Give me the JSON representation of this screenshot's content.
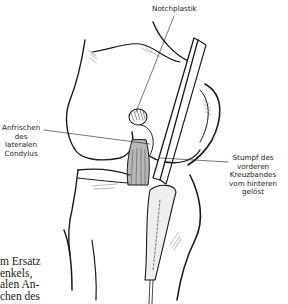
{
  "figure": {
    "labels": {
      "notchplastik": {
        "lines": [
          "Notchplastik"
        ]
      },
      "condylus": {
        "lines": [
          "Anfrischen",
          "des",
          "lateralen",
          "Condylus"
        ]
      },
      "stumpf": {
        "lines": [
          "Stumpf des",
          "vorderen",
          "Kreuzbandes",
          "vom hinteren",
          "gelöst"
        ]
      }
    }
  },
  "body_text": {
    "lines": [
      "m Ersatz",
      "enkels,",
      "alen An-",
      "chen des"
    ]
  },
  "colors": {
    "ink": "#1a1a1a",
    "background": "#ffffff",
    "shading": "#9a9a9a",
    "label_text": "#222222"
  }
}
